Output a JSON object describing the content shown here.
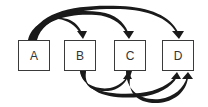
{
  "diagram": {
    "type": "directed-graph",
    "nodes": [
      {
        "id": "A",
        "label": "A"
      },
      {
        "id": "B",
        "label": "B"
      },
      {
        "id": "C",
        "label": "C"
      },
      {
        "id": "D",
        "label": "D"
      }
    ],
    "edges": [
      {
        "from": "A",
        "to": "B",
        "side": "top"
      },
      {
        "from": "A",
        "to": "C",
        "side": "top"
      },
      {
        "from": "A",
        "to": "D",
        "side": "top"
      },
      {
        "from": "B",
        "to": "C",
        "side": "bottom"
      },
      {
        "from": "B",
        "to": "D",
        "side": "bottom"
      },
      {
        "from": "C",
        "to": "D",
        "side": "bottom"
      }
    ],
    "colors": {
      "stroke": "#1a1a1a",
      "box_border": "#3a3a3a",
      "background": "#ffffff"
    }
  }
}
